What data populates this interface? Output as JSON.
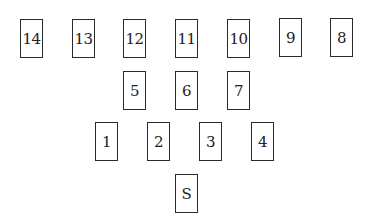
{
  "diagram": {
    "rows": [
      {
        "name": "row-top",
        "cards": [
          "14",
          "13",
          "12",
          "11",
          "10",
          "9",
          "8"
        ]
      },
      {
        "name": "row-middle",
        "cards": [
          "5",
          "6",
          "7"
        ]
      },
      {
        "name": "row-lower",
        "cards": [
          "1",
          "2",
          "3",
          "4"
        ]
      },
      {
        "name": "row-bottom",
        "cards": [
          "S"
        ]
      }
    ],
    "border_color": "#2a2a2a",
    "text_color": "#222222",
    "background": "#ffffff"
  }
}
